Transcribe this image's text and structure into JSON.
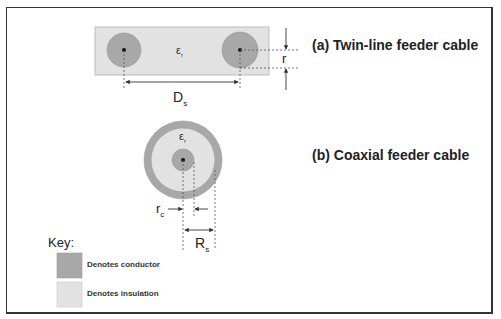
{
  "colors": {
    "conductor": "#a8a8a8",
    "insulation": "#e2e2e2",
    "frame": "#333333",
    "line": "#444444"
  },
  "twin_line": {
    "title": "(a) Twin-line feeder cable",
    "permittivity": {
      "symbol": "ε",
      "subscript": "r"
    },
    "separation": {
      "symbol": "D",
      "subscript": "s"
    },
    "radius": {
      "symbol": "r"
    }
  },
  "coaxial": {
    "title": "(b) Coaxial feeder cable",
    "permittivity": {
      "symbol": "ε",
      "subscript": "r"
    },
    "inner_radius": {
      "symbol": "r",
      "subscript": "c"
    },
    "shield_radius": {
      "symbol": "R",
      "subscript": "s"
    }
  },
  "key": {
    "title": "Key:",
    "items": [
      {
        "label": "Denotes conductor",
        "swatch": "conductor"
      },
      {
        "label": "Denotes insulation",
        "swatch": "insulation"
      }
    ]
  }
}
